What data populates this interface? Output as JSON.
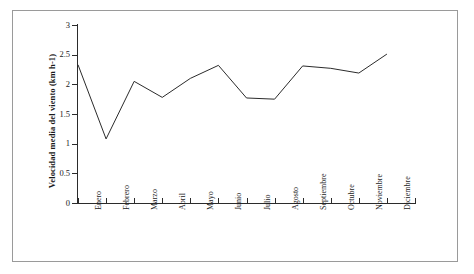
{
  "chart_data": {
    "type": "line",
    "title": "",
    "xlabel": "",
    "ylabel": "Velocidad media del viento (km h-1)",
    "categories": [
      "Enero",
      "Febrero",
      "Marzo",
      "Abril",
      "Mayo",
      "Junio",
      "Julio",
      "Agosto",
      "Septiembre",
      "Octubre",
      "Noviembre",
      "Diciembre"
    ],
    "values": [
      2.33,
      1.08,
      2.05,
      1.78,
      2.1,
      2.32,
      1.77,
      1.75,
      2.31,
      2.27,
      2.19,
      2.51
    ],
    "ylim": [
      0,
      3
    ],
    "ytick_labels": [
      "0",
      "0.5",
      "1",
      "1.5",
      "2",
      "2.5",
      "3"
    ],
    "ytick_values": [
      0,
      0.5,
      1,
      1.5,
      2,
      2.5,
      3
    ],
    "grid": false,
    "legend": false,
    "series_color": "#2b2b2b",
    "axis_color": "#2b2b2b",
    "frame_color": "#9a9a9a",
    "background": "#ffffff"
  }
}
